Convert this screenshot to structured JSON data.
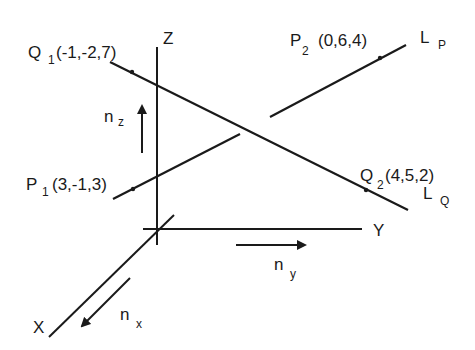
{
  "diagram": {
    "axes": {
      "z": {
        "label": "Z"
      },
      "y": {
        "label": "Y"
      },
      "x": {
        "label": "X"
      }
    },
    "unit_vectors": {
      "nz": {
        "main": "n",
        "sub": "z"
      },
      "ny": {
        "main": "n",
        "sub": "y"
      },
      "nx": {
        "main": "n",
        "sub": "x"
      }
    },
    "points": {
      "Q1": {
        "main": "Q",
        "sub": "1",
        "coords": "(-1,-2,7)"
      },
      "Q2": {
        "main": "Q",
        "sub": "2",
        "coords": "(4,5,2)"
      },
      "P1": {
        "main": "P",
        "sub": "1",
        "coords": "(3,-1,3)"
      },
      "P2": {
        "main": "P",
        "sub": "2",
        "coords": "(0,6,4)"
      }
    },
    "lines": {
      "LP": {
        "main": "L",
        "sub": "P"
      },
      "LQ": {
        "main": "L",
        "sub": "Q"
      }
    },
    "colors": {
      "ink": "#1a1a1a",
      "background": "#ffffff"
    }
  }
}
